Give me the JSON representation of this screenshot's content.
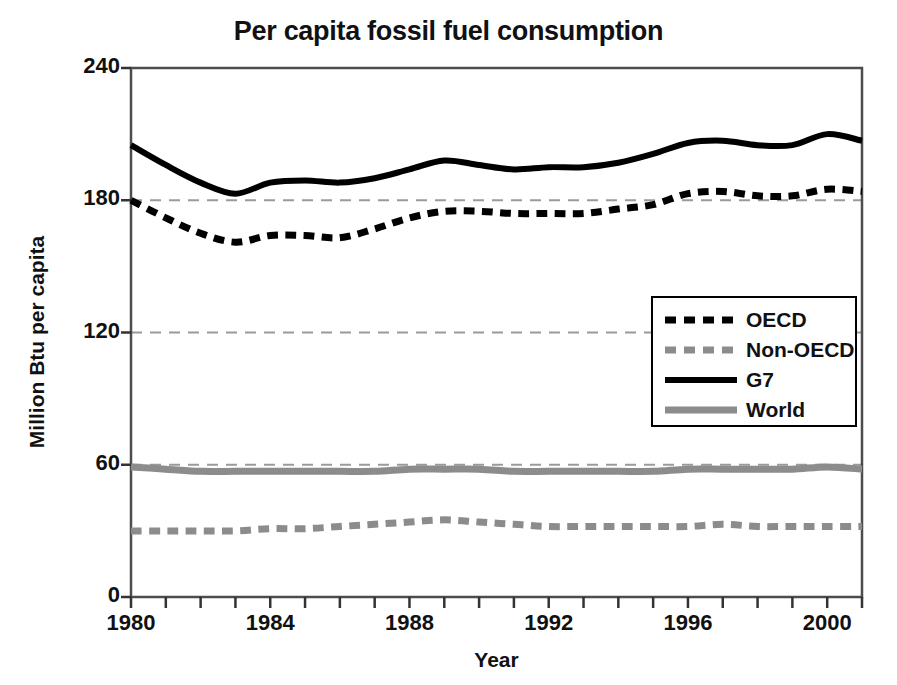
{
  "chart_data": {
    "type": "line",
    "title": "Per capita fossil fuel consumption",
    "xlabel": "Year",
    "ylabel": "Million Btu per capita",
    "xlim": [
      1980,
      2001
    ],
    "ylim": [
      0,
      240
    ],
    "yticks": [
      0,
      60,
      120,
      180,
      240
    ],
    "ytick_labels": [
      "0",
      "60",
      "120",
      "180",
      "240"
    ],
    "xticks": [
      1980,
      1981,
      1982,
      1983,
      1984,
      1985,
      1986,
      1987,
      1988,
      1989,
      1990,
      1991,
      1992,
      1993,
      1994,
      1995,
      1996,
      1997,
      1998,
      1999,
      2000,
      2001
    ],
    "xtick_labels_shown": [
      "1980",
      "1984",
      "1988",
      "1992",
      "1996",
      "2000"
    ],
    "xtick_labels_shown_values": [
      1980,
      1984,
      1988,
      1992,
      1996,
      2000
    ],
    "grid": "horizontal-dashed",
    "legend_position": "middle-right",
    "x": [
      1980,
      1981,
      1982,
      1983,
      1984,
      1985,
      1986,
      1987,
      1988,
      1989,
      1990,
      1991,
      1992,
      1993,
      1994,
      1995,
      1996,
      1997,
      1998,
      1999,
      2000,
      2001
    ],
    "series": [
      {
        "name": "OECD",
        "color": "#000000",
        "style": "dashed",
        "width": 7,
        "values": [
          180,
          172,
          165,
          161,
          164,
          164,
          163,
          167,
          172,
          175,
          175,
          174,
          174,
          174,
          176,
          178,
          183,
          184,
          182,
          182,
          185,
          184
        ]
      },
      {
        "name": "Non-OECD",
        "color": "#8c8c8c",
        "style": "dashed",
        "width": 7,
        "values": [
          30,
          30,
          30,
          30,
          31,
          31,
          32,
          33,
          34,
          35,
          34,
          33,
          32,
          32,
          32,
          32,
          32,
          33,
          32,
          32,
          32,
          32
        ]
      },
      {
        "name": "G7",
        "color": "#000000",
        "style": "solid",
        "width": 6,
        "values": [
          205,
          196,
          188,
          183,
          188,
          189,
          188,
          190,
          194,
          198,
          196,
          194,
          195,
          195,
          197,
          201,
          206,
          207,
          205,
          205,
          210,
          207
        ]
      },
      {
        "name": "World",
        "color": "#8c8c8c",
        "style": "solid",
        "width": 7,
        "values": [
          59,
          58,
          57,
          57,
          57,
          57,
          57,
          57,
          58,
          58,
          58,
          57,
          57,
          57,
          57,
          57,
          58,
          58,
          58,
          58,
          59,
          58
        ]
      }
    ]
  },
  "legend": {
    "items": [
      {
        "label": "OECD"
      },
      {
        "label": "Non-OECD"
      },
      {
        "label": "G7"
      },
      {
        "label": "World"
      }
    ]
  },
  "colors": {
    "dark": "#000000",
    "gray": "#8c8c8c",
    "grid": "#9a9a9a",
    "axis": "#4d4d4d",
    "background": "#ffffff"
  }
}
